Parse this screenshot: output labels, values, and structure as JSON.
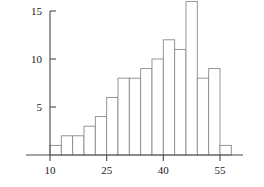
{
  "chart_data": {
    "type": "bar",
    "title": "",
    "subtitle": "",
    "xlabel": "",
    "ylabel": "",
    "grid": false,
    "legend": false,
    "legend_position": "none",
    "bin_width": 3,
    "bin_edges": [
      10,
      13,
      16,
      19,
      22,
      25,
      28,
      31,
      34,
      37,
      40,
      43,
      46,
      49,
      52,
      55,
      58
    ],
    "categories": [
      "10-13",
      "13-16",
      "16-19",
      "19-22",
      "22-25",
      "25-28",
      "28-31",
      "31-34",
      "34-37",
      "37-40",
      "40-43",
      "43-46",
      "46-49",
      "49-52",
      "52-55",
      "55-58"
    ],
    "values": [
      1,
      2,
      2,
      3,
      4,
      6,
      8,
      8,
      9,
      10,
      12,
      11,
      16,
      8,
      9,
      1
    ],
    "x": [
      11.5,
      14.5,
      17.5,
      20.5,
      23.5,
      26.5,
      29.5,
      32.5,
      35.5,
      38.5,
      41.5,
      44.5,
      47.5,
      50.5,
      53.5,
      56.5
    ],
    "xlim": [
      6,
      62
    ],
    "ylim": [
      0,
      16.5
    ],
    "xticks": [
      10,
      25,
      40,
      55
    ],
    "xticklabels": [
      "10",
      "25",
      "40",
      "55"
    ],
    "yticks": [
      5,
      10,
      15
    ],
    "yticklabels": [
      "5",
      "10",
      "15"
    ],
    "colors": {
      "bar_fill": "#ffffff",
      "bar_stroke": "#8a8a8a",
      "axis": "#4a4a4a",
      "text": "#1a1a1a",
      "background": "#ffffff"
    }
  }
}
